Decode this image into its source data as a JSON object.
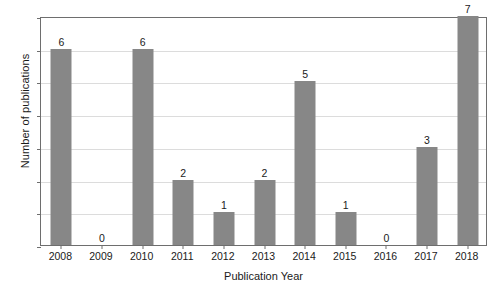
{
  "chart_data": {
    "type": "bar",
    "title": "",
    "xlabel": "Publication Year",
    "ylabel": "Number of publications",
    "categories": [
      "2008",
      "2009",
      "2010",
      "2011",
      "2012",
      "2013",
      "2014",
      "2015",
      "2016",
      "2017",
      "2018"
    ],
    "values": [
      6,
      0,
      6,
      2,
      1,
      2,
      5,
      1,
      0,
      3,
      7
    ],
    "data_labels": [
      "6",
      "0",
      "6",
      "2",
      "1",
      "2",
      "5",
      "1",
      "0",
      "3",
      "7"
    ],
    "ylim": [
      0,
      7
    ],
    "ytick_labels": [
      "0",
      "1",
      "2",
      "3",
      "4",
      "5",
      "6",
      "7"
    ],
    "ytick_values": [
      0,
      1,
      2,
      3,
      4,
      5,
      6,
      7
    ],
    "grid": true,
    "grid_axis": "y",
    "legend": false,
    "legend_position": "none",
    "bar_color": "#878787",
    "grid_color": "#dcdcdc",
    "frame_color": "#6e6e6e",
    "background_color": "#ffffff",
    "text_color": "#1a1a1a"
  }
}
